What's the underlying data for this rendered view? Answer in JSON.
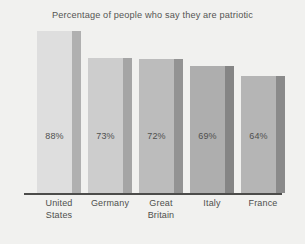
{
  "chart_data": {
    "type": "bar",
    "title": "Percentage of people who say they are patriotic",
    "xlabel": "",
    "ylabel": "",
    "ylim": [
      0,
      100
    ],
    "grid": false,
    "legend": null,
    "categories": [
      "United States",
      "Germany",
      "Great Britain",
      "Italy",
      "France"
    ],
    "values": [
      88,
      73,
      72,
      69,
      64
    ],
    "value_labels": [
      "88%",
      "73%",
      "72%",
      "69%",
      "64%"
    ],
    "category_lines": [
      [
        "United",
        "States"
      ],
      [
        "Germany",
        ""
      ],
      [
        "Great",
        "Britain"
      ],
      [
        "Italy",
        ""
      ],
      [
        "France",
        ""
      ]
    ],
    "bars": [
      {
        "category": "United States",
        "value": 88,
        "label": "88%",
        "face_color": "#dedede",
        "side_color": "#b0b0b0",
        "left": 37,
        "width": 44,
        "top": 31
      },
      {
        "category": "Germany",
        "value": 73,
        "label": "73%",
        "face_color": "#cdcdcd",
        "side_color": "#a5a5a5",
        "left": 88,
        "width": 44,
        "top": 58
      },
      {
        "category": "Great Britain",
        "value": 72,
        "label": "72%",
        "face_color": "#bcbcbc",
        "side_color": "#939393",
        "left": 139,
        "width": 44,
        "top": 59
      },
      {
        "category": "Italy",
        "value": 69,
        "label": "69%",
        "face_color": "#aeaeae",
        "side_color": "#858585",
        "left": 190,
        "width": 44,
        "top": 66
      },
      {
        "category": "France",
        "value": 64,
        "label": "64%",
        "face_color": "#b5b5b5",
        "side_color": "#8a8a8a",
        "left": 241,
        "width": 44,
        "top": 76
      }
    ],
    "axis_color": "#4c4c4a",
    "background_color": "#f1f1ef",
    "title_color": "#555553",
    "label_color": "#4f4f4d"
  }
}
